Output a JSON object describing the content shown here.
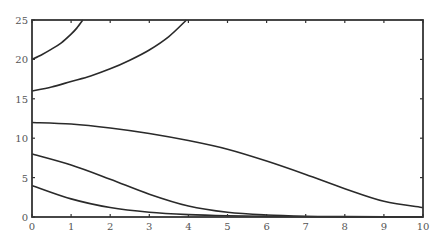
{
  "chart_data": {
    "type": "line",
    "title": "",
    "xlabel": "",
    "ylabel": "",
    "xlim": [
      0,
      10
    ],
    "ylim": [
      0,
      25
    ],
    "grid": false,
    "legend": null,
    "x_ticks": [
      "0",
      "1",
      "2",
      "3",
      "4",
      "5",
      "6",
      "7",
      "8",
      "9",
      "10"
    ],
    "y_ticks": [
      "0",
      "5",
      "10",
      "15",
      "20",
      "25"
    ],
    "series": [
      {
        "name": "y0=20",
        "x": [
          0,
          0.25,
          0.5,
          0.75,
          1.0,
          1.15,
          1.3
        ],
        "y": [
          20,
          20.6,
          21.3,
          22.1,
          23.2,
          24.0,
          25
        ]
      },
      {
        "name": "y0=16",
        "x": [
          0,
          0.5,
          1,
          1.5,
          2,
          2.5,
          3,
          3.5,
          3.95
        ],
        "y": [
          16,
          16.5,
          17.2,
          17.9,
          18.8,
          19.9,
          21.2,
          22.9,
          25
        ]
      },
      {
        "name": "y0=12",
        "x": [
          0,
          1,
          2,
          3,
          4,
          5,
          6,
          7,
          8,
          9,
          10
        ],
        "y": [
          12,
          11.8,
          11.3,
          10.6,
          9.7,
          8.6,
          7.1,
          5.4,
          3.6,
          2.0,
          1.2
        ]
      },
      {
        "name": "y0=8",
        "x": [
          0,
          1,
          2,
          3,
          4,
          5,
          6,
          7,
          8,
          9,
          10
        ],
        "y": [
          8,
          6.6,
          4.8,
          2.9,
          1.4,
          0.6,
          0.25,
          0.1,
          0.05,
          0.02,
          0.01
        ]
      },
      {
        "name": "y0=4",
        "x": [
          0,
          1,
          2,
          3,
          4,
          5,
          6,
          7,
          8,
          9,
          10
        ],
        "y": [
          4,
          2.3,
          1.2,
          0.6,
          0.3,
          0.15,
          0.08,
          0.04,
          0.02,
          0.01,
          0
        ]
      }
    ]
  }
}
